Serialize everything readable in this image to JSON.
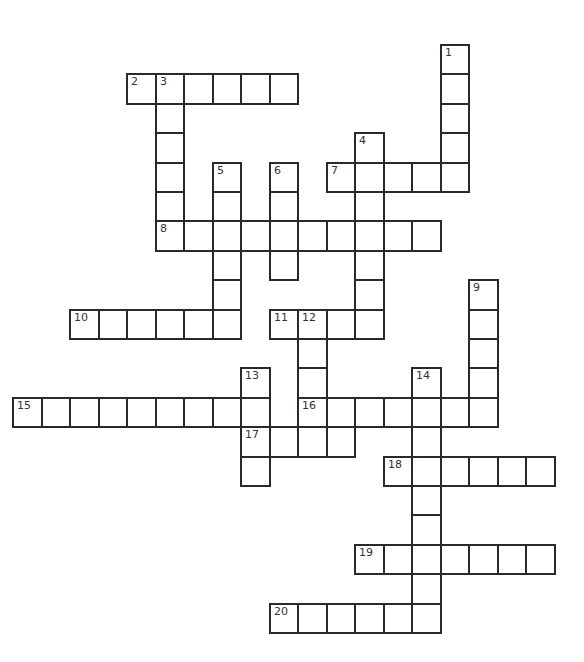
{
  "puzzle": {
    "title": "Crossword",
    "grid": {
      "origin_x": 13,
      "origin_y": 45,
      "col_step": 28.5,
      "row_step": 29.4
    },
    "border_color": "#2a2a2a",
    "background": "#ffffff",
    "entries": [
      {
        "number": 1,
        "direction": "down",
        "row": 0,
        "col": 15,
        "length": 5
      },
      {
        "number": 2,
        "direction": "across",
        "row": 1,
        "col": 4,
        "length": 6
      },
      {
        "number": 3,
        "direction": "down",
        "row": 1,
        "col": 5,
        "length": 6
      },
      {
        "number": 4,
        "direction": "down",
        "row": 3,
        "col": 12,
        "length": 7
      },
      {
        "number": 5,
        "direction": "down",
        "row": 4,
        "col": 7,
        "length": 6
      },
      {
        "number": 6,
        "direction": "down",
        "row": 4,
        "col": 9,
        "length": 4
      },
      {
        "number": 7,
        "direction": "across",
        "row": 4,
        "col": 11,
        "length": 5
      },
      {
        "number": 8,
        "direction": "across",
        "row": 6,
        "col": 5,
        "length": 10
      },
      {
        "number": 9,
        "direction": "down",
        "row": 8,
        "col": 16,
        "length": 5
      },
      {
        "number": 10,
        "direction": "across",
        "row": 9,
        "col": 2,
        "length": 6
      },
      {
        "number": 11,
        "direction": "across",
        "row": 9,
        "col": 9,
        "length": 4
      },
      {
        "number": 12,
        "direction": "down",
        "row": 9,
        "col": 10,
        "length": 5
      },
      {
        "number": 13,
        "direction": "down",
        "row": 11,
        "col": 8,
        "length": 4
      },
      {
        "number": 14,
        "direction": "down",
        "row": 11,
        "col": 14,
        "length": 9
      },
      {
        "number": 15,
        "direction": "across",
        "row": 12,
        "col": 0,
        "length": 9
      },
      {
        "number": 16,
        "direction": "across",
        "row": 12,
        "col": 10,
        "length": 7
      },
      {
        "number": 17,
        "direction": "across",
        "row": 13,
        "col": 8,
        "length": 4
      },
      {
        "number": 18,
        "direction": "across",
        "row": 14,
        "col": 13,
        "length": 6
      },
      {
        "number": 19,
        "direction": "across",
        "row": 17,
        "col": 12,
        "length": 7
      },
      {
        "number": 20,
        "direction": "across",
        "row": 19,
        "col": 9,
        "length": 6
      }
    ]
  }
}
